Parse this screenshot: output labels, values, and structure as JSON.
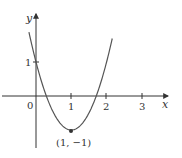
{
  "chart_data": {
    "type": "line",
    "title": "",
    "xlabel": "x",
    "ylabel": "y",
    "function": "y = 2(x-1)^2 - 1",
    "xlim": [
      -1.0,
      3.7
    ],
    "ylim": [
      -1.4,
      2.3
    ],
    "x_ticks": [
      1,
      2,
      3
    ],
    "x_tick_labels": [
      "1",
      "2",
      "3"
    ],
    "y_ticks": [
      1
    ],
    "y_tick_labels": [
      "1"
    ],
    "origin_label": "0",
    "grid": false,
    "legend": null,
    "series": [
      {
        "name": "parabola",
        "x": [
          -0.2,
          0,
          0.29,
          0.5,
          1,
          1.5,
          1.71,
          2,
          2.17
        ],
        "y": [
          1.88,
          1,
          0,
          -0.5,
          -1,
          -0.5,
          0,
          1,
          1.74
        ]
      }
    ],
    "points": [
      {
        "x": 1,
        "y": -1,
        "label": "(1, −1)",
        "marker": "dot"
      }
    ],
    "colors": {
      "curve": "#555555",
      "axes": "#333333",
      "text": "#333333"
    }
  }
}
